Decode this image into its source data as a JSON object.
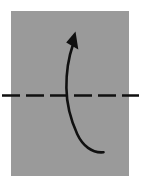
{
  "figure": {
    "caption": "Gray square sheet with a horizontal dashed fold line and a curved arrow sweeping upward",
    "background_color": "#ffffff"
  },
  "chart_data": {
    "type": "diagram",
    "xlabel": "",
    "ylabel": "",
    "canvas": {
      "width": 141,
      "height": 185
    },
    "grid": false,
    "legend": null,
    "colors": {
      "background": "#ffffff",
      "paper_fill": "#9a9a9a",
      "paper_stroke": "#8f8f8f",
      "ink": "#101010"
    },
    "elements": [
      {
        "name": "paper-square",
        "shape": "rect",
        "label": "paper sheet",
        "x": 11,
        "y": 11,
        "width": 118,
        "height": 165,
        "fill": "#9a9a9a"
      },
      {
        "name": "fold-line",
        "shape": "dashed-line",
        "label": "fold line",
        "x1": 2,
        "y1": 95.5,
        "x2": 139,
        "y2": 95.5,
        "stroke": "#101010",
        "stroke_width": 2.6,
        "dash_pattern": "18 6"
      },
      {
        "name": "fold-arrow",
        "shape": "curved-arrow",
        "label": "fold direction arrow",
        "path": "M 103.5 152.2 C 92 153.4 82.5 145.5 77.2 134.0 C 70.6 119.6 66.6 104.0 66.4 88.0 C 66.2 70.5 69.0 56.0 73.0 44.5",
        "stroke": "#101010",
        "stroke_width": 2.6,
        "tip_x": 75.5,
        "tip_y": 31.5,
        "tail_x": 103.5,
        "tail_y": 152.2
      },
      {
        "name": "arrow-head",
        "shape": "triangle",
        "label": "arrowhead",
        "points": "75.5,31.5 78.3,49.5 66.2,42.6",
        "fill": "#101010"
      }
    ]
  }
}
